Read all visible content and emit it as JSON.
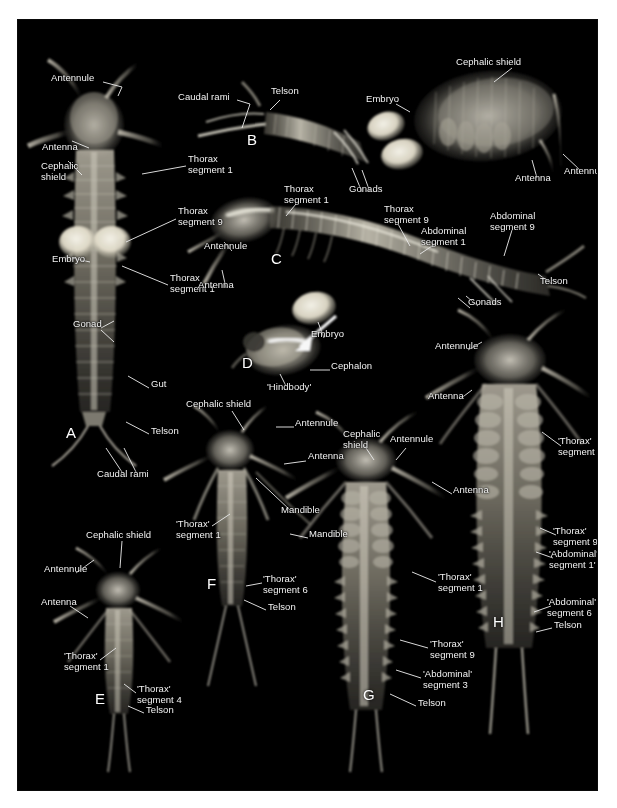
{
  "figure": {
    "background": "#ffffff",
    "plate_color": "#000000",
    "label_color": "#f2f2f2",
    "panels": [
      "A",
      "B",
      "C",
      "D",
      "E",
      "F",
      "G",
      "H"
    ]
  },
  "panel_letters": [
    {
      "text": "A",
      "x": 48,
      "y": 411
    },
    {
      "text": "B",
      "x": 229,
      "y": 118
    },
    {
      "text": "C",
      "x": 253,
      "y": 237
    },
    {
      "text": "D",
      "x": 224,
      "y": 341
    },
    {
      "text": "E",
      "x": 77,
      "y": 677
    },
    {
      "text": "F",
      "x": 189,
      "y": 562
    },
    {
      "text": "G",
      "x": 345,
      "y": 673
    },
    {
      "text": "H",
      "x": 475,
      "y": 600
    }
  ],
  "labels": [
    {
      "id": "a-antennule",
      "text": "Antennule",
      "x": 33,
      "y": 59,
      "align": "left"
    },
    {
      "id": "a-antenna",
      "text": "Antenna",
      "x": 24,
      "y": 128,
      "align": "left"
    },
    {
      "id": "a-cephalic-shield",
      "text": "Cephalic\nshield",
      "x": 23,
      "y": 147,
      "align": "left"
    },
    {
      "id": "a-thorax-1",
      "text": "Thorax\nsegment 1",
      "x": 170,
      "y": 140,
      "align": "left"
    },
    {
      "id": "a-thorax-9",
      "text": "Thorax\nsegment 9",
      "x": 160,
      "y": 192,
      "align": "left"
    },
    {
      "id": "a-embryo",
      "text": "Embryo",
      "x": 34,
      "y": 240,
      "align": "left"
    },
    {
      "id": "a-thorax-1b",
      "text": "Thorax\nsegment 1",
      "x": 152,
      "y": 259,
      "align": "left"
    },
    {
      "id": "a-gonad",
      "text": "Gonad",
      "x": 55,
      "y": 305,
      "align": "left"
    },
    {
      "id": "a-gut",
      "text": "Gut",
      "x": 133,
      "y": 365,
      "align": "left"
    },
    {
      "id": "a-telson",
      "text": "Telson",
      "x": 133,
      "y": 412,
      "align": "left"
    },
    {
      "id": "a-caudal-rami",
      "text": "Caudal rami",
      "x": 79,
      "y": 455,
      "align": "left"
    },
    {
      "id": "b-caudal-rami",
      "text": "Caudal rami",
      "x": 160,
      "y": 78,
      "align": "left"
    },
    {
      "id": "b-telson",
      "text": "Telson",
      "x": 253,
      "y": 72,
      "align": "left"
    },
    {
      "id": "b-embryo",
      "text": "Embryo",
      "x": 348,
      "y": 80,
      "align": "left"
    },
    {
      "id": "b-gonads",
      "text": "Gonads",
      "x": 331,
      "y": 170,
      "align": "left"
    },
    {
      "id": "b-cephalic-shield",
      "text": "Cephalic shield",
      "x": 438,
      "y": 43,
      "align": "left"
    },
    {
      "id": "b-antenna",
      "text": "Antenna",
      "x": 497,
      "y": 159,
      "align": "left"
    },
    {
      "id": "b-antennule",
      "text": "Antennule",
      "x": 551,
      "y": 152,
      "align": "left"
    },
    {
      "id": "c-thorax-1",
      "text": "Thorax\nsegment 1",
      "x": 266,
      "y": 170,
      "align": "left"
    },
    {
      "id": "c-thorax-9",
      "text": "Thorax\nsegment 9",
      "x": 366,
      "y": 190,
      "align": "left"
    },
    {
      "id": "c-abdominal-1",
      "text": "Abdominal\nsegment 1",
      "x": 403,
      "y": 212,
      "align": "left"
    },
    {
      "id": "c-abdominal-9",
      "text": "Abdominal\nsegment 9",
      "x": 472,
      "y": 197,
      "align": "left"
    },
    {
      "id": "c-telson",
      "text": "Telson",
      "x": 522,
      "y": 262,
      "align": "left"
    },
    {
      "id": "c-gonads",
      "text": "Gonads",
      "x": 450,
      "y": 283,
      "align": "left"
    },
    {
      "id": "c-antennule",
      "text": "Antennule",
      "x": 186,
      "y": 227,
      "align": "left"
    },
    {
      "id": "c-antenna",
      "text": "Antenna",
      "x": 180,
      "y": 266,
      "align": "left"
    },
    {
      "id": "c-embryo",
      "text": "Embryo",
      "x": 293,
      "y": 315,
      "align": "left"
    },
    {
      "id": "d-cephalon",
      "text": "Cephalon",
      "x": 313,
      "y": 347,
      "align": "left"
    },
    {
      "id": "d-hindbody",
      "text": "'Hindbody'",
      "x": 249,
      "y": 368,
      "align": "left"
    },
    {
      "id": "f-cephalic-shield",
      "text": "Cephalic shield",
      "x": 168,
      "y": 385,
      "align": "left"
    },
    {
      "id": "f-antennule",
      "text": "Antennule",
      "x": 277,
      "y": 404,
      "align": "left"
    },
    {
      "id": "f-antenna",
      "text": "Antenna",
      "x": 290,
      "y": 437,
      "align": "left"
    },
    {
      "id": "f-mandible-1",
      "text": "Mandible",
      "x": 263,
      "y": 491,
      "align": "left"
    },
    {
      "id": "f-mandible-2",
      "text": "Mandible",
      "x": 291,
      "y": 515,
      "align": "left"
    },
    {
      "id": "f-thorax-1",
      "text": "'Thorax'\nsegment 1",
      "x": 158,
      "y": 505,
      "align": "left"
    },
    {
      "id": "f-thorax-6",
      "text": "'Thorax'\nsegment 6",
      "x": 245,
      "y": 560,
      "align": "left"
    },
    {
      "id": "f-telson",
      "text": "Telson",
      "x": 250,
      "y": 588,
      "align": "left"
    },
    {
      "id": "e-cephalic-shield",
      "text": "Cephalic shield",
      "x": 68,
      "y": 516,
      "align": "left"
    },
    {
      "id": "e-antennule",
      "text": "Antennule",
      "x": 26,
      "y": 550,
      "align": "left"
    },
    {
      "id": "e-antenna",
      "text": "Antenna",
      "x": 23,
      "y": 583,
      "align": "left"
    },
    {
      "id": "e-thorax-1",
      "text": "'Thorax'\nsegment 1",
      "x": 46,
      "y": 637,
      "align": "left"
    },
    {
      "id": "e-thorax-4",
      "text": "'Thorax'\nsegment 4",
      "x": 119,
      "y": 670,
      "align": "left"
    },
    {
      "id": "e-telson",
      "text": "Telson",
      "x": 128,
      "y": 691,
      "align": "left"
    },
    {
      "id": "g-cephalic-shield",
      "text": "Cephalic\nshield",
      "x": 325,
      "y": 415,
      "align": "left"
    },
    {
      "id": "g-antennule",
      "text": "Antennule",
      "x": 372,
      "y": 420,
      "align": "left"
    },
    {
      "id": "g-antenna",
      "text": "Antenna",
      "x": 435,
      "y": 471,
      "align": "left"
    },
    {
      "id": "g-thorax-1",
      "text": "'Thorax'\nsegment 1",
      "x": 420,
      "y": 558,
      "align": "left"
    },
    {
      "id": "g-thorax-9",
      "text": "'Thorax'\nsegment 9",
      "x": 412,
      "y": 625,
      "align": "left"
    },
    {
      "id": "g-abdominal-3",
      "text": "'Abdominal'\nsegment 3",
      "x": 405,
      "y": 655,
      "align": "left"
    },
    {
      "id": "g-telson",
      "text": "Telson",
      "x": 400,
      "y": 684,
      "align": "left"
    },
    {
      "id": "h-antenna",
      "text": "Antenna",
      "x": 410,
      "y": 377,
      "align": "left"
    },
    {
      "id": "h-antennule",
      "text": "Antennule",
      "x": 417,
      "y": 327,
      "align": "left"
    },
    {
      "id": "h-thorax-1",
      "text": "'Thorax'\nsegment 1",
      "x": 545,
      "y": 422,
      "align": "left"
    },
    {
      "id": "h-thorax-9",
      "text": "'Thorax'\nsegment 9",
      "x": 540,
      "y": 512,
      "align": "left"
    },
    {
      "id": "h-abdominal-1",
      "text": "'Abdominal'\nsegment 1'",
      "x": 537,
      "y": 535,
      "align": "left"
    },
    {
      "id": "h-abdominal-6",
      "text": "'Abdominal'\nsegment 6",
      "x": 535,
      "y": 583,
      "align": "left"
    },
    {
      "id": "h-telson",
      "text": "Telson",
      "x": 536,
      "y": 606,
      "align": "left"
    }
  ],
  "anatomy_terms": [
    "Antennule",
    "Antenna",
    "Cephalic shield",
    "Cephalon",
    "'Hindbody'",
    "Mandible",
    "Thorax segment 1",
    "Thorax segment 9",
    "'Thorax' segment 1",
    "'Thorax' segment 4",
    "'Thorax' segment 6",
    "'Thorax' segment 9",
    "Abdominal segment 1",
    "Abdominal segment 9",
    "'Abdominal' segment 1'",
    "'Abdominal' segment 3",
    "'Abdominal' segment 6",
    "Telson",
    "Caudal rami",
    "Gut",
    "Gonad",
    "Gonads",
    "Embryo"
  ]
}
